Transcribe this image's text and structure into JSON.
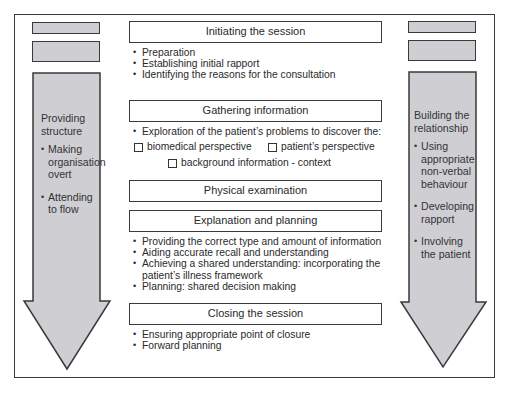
{
  "colors": {
    "panel_fill": "#cfcfd3",
    "border": "#3a3a3a",
    "background": "#ffffff"
  },
  "left_column": {
    "title": "Providing structure",
    "bullets": [
      "Making organisation overt",
      "Attending to flow"
    ]
  },
  "right_column": {
    "title": "Building the relationship",
    "bullets": [
      "Using appropriate non-verbal behaviour",
      "Developing rapport",
      "Involving the patient"
    ]
  },
  "stages": [
    {
      "title": "Initiating the session",
      "bullets": [
        "Preparation",
        "Establishing initial rapport",
        "Identifying the reasons for the consultation"
      ]
    },
    {
      "title": "Gathering information",
      "bullets": [
        "Exploration of the patient’s problems to discover the:"
      ],
      "checkboxes": [
        "biomedical perspective",
        "patient’s perspective",
        "background information - context"
      ]
    },
    {
      "title": "Physical examination",
      "bullets": []
    },
    {
      "title": "Explanation and planning",
      "bullets": [
        "Providing the correct type and amount of information",
        "Aiding accurate recall and understanding",
        "Achieving a shared understanding: incorporating the patient’s illness framework",
        "Planning: shared decision making"
      ]
    },
    {
      "title": "Closing the session",
      "bullets": [
        "Ensuring appropriate point of closure",
        "Forward planning"
      ]
    }
  ]
}
